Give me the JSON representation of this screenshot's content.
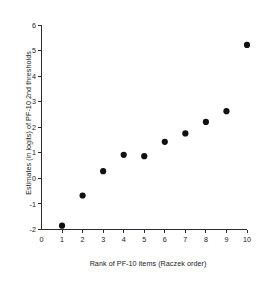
{
  "chart_data": {
    "type": "scatter",
    "title": "",
    "xlabel": "Rank of PF-10 items (Raczek order)",
    "ylabel": "Estimates (in logits) of PF-10 2nd thresholds",
    "xlim": [
      0,
      10
    ],
    "ylim": [
      -2,
      6
    ],
    "xticks": [
      0,
      1,
      2,
      3,
      4,
      5,
      6,
      7,
      8,
      9,
      10
    ],
    "yticks": [
      -2,
      -1,
      0,
      1,
      2,
      3,
      4,
      5,
      6
    ],
    "xticklabels": [
      "0",
      "1",
      "2",
      "3",
      "4",
      "5",
      "6",
      "7",
      "8",
      "9",
      "10"
    ],
    "yticklabels": [
      "-2",
      "-1",
      "0",
      "1",
      "2",
      "3",
      "4",
      "5",
      "6"
    ],
    "grid": false,
    "legend": false,
    "marker": "filled-circle",
    "marker_color": "#111111",
    "x": [
      1,
      2,
      3,
      4,
      5,
      6,
      7,
      8,
      9,
      10
    ],
    "values": [
      -1.85,
      -0.67,
      0.28,
      0.92,
      0.87,
      1.43,
      1.76,
      2.21,
      2.63,
      5.22
    ],
    "series": [
      {
        "name": "PF-10 2nd thresholds",
        "x": [
          1,
          2,
          3,
          4,
          5,
          6,
          7,
          8,
          9,
          10
        ],
        "values": [
          -1.85,
          -0.67,
          0.28,
          0.92,
          0.87,
          1.43,
          1.76,
          2.21,
          2.63,
          5.22
        ]
      }
    ]
  }
}
